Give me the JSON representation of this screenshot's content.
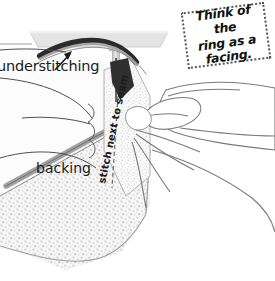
{
  "illustration": {
    "title": "Understitching a ring facing at the sewing machine",
    "width": 275,
    "height": 281,
    "background_color": "#ffffff"
  },
  "callout": {
    "text": "Think of the\nring as a\nfacing.",
    "border_style": "dotted",
    "border_color": "#555555",
    "rotation_deg": -7.5
  },
  "labels": {
    "understitching": "understitching",
    "backing": "backing",
    "stitch_next_to_seam": "stitch next to seam"
  },
  "icons": {
    "arrow": "arrow-pointer-icon",
    "needle": "sewing-needle-icon",
    "presser_foot": "presser-foot-icon"
  },
  "colors": {
    "ink": "#1b1b1b",
    "outline": "#6e6e6e",
    "machine_bed": "#e2e2e2",
    "machine_bed_edge": "#c6c6c6",
    "presser_shaft": "#c9c9c9",
    "dark_band": "#2a2a2a",
    "seam_gray": "#9a9a9a",
    "fabric_stipple": "#d8d8d8",
    "fabric_light": "#f2f2f2",
    "hand_line": "#777777"
  }
}
